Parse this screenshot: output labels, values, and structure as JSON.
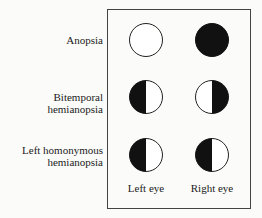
{
  "rows": [
    {
      "label": "Anopsia",
      "label_lines": [
        "Anopsia"
      ],
      "left": "clear",
      "right": "full"
    },
    {
      "label": "Bitemporal hemianopsia",
      "label_lines": [
        "Bitemporal hemianopsia"
      ],
      "left": "left-half",
      "right": "right-half"
    },
    {
      "label": "Left homonymous hemianopsia",
      "label_lines": [
        "Left homonymous",
        "hemianopsia"
      ],
      "left": "left-half",
      "right": "left-half"
    }
  ],
  "columns": {
    "left": "Left eye",
    "right": "Right eye"
  }
}
